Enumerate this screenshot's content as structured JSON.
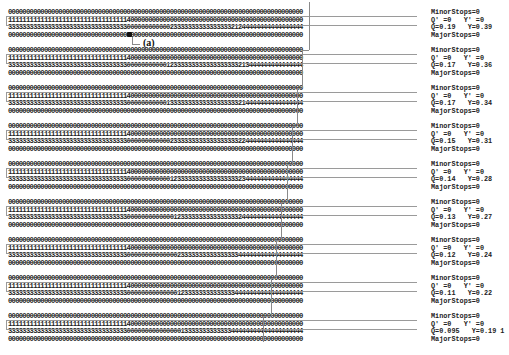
{
  "figure": {
    "annotation_label": "(a)",
    "blocks": [
      {
        "rows": [
          "0000000000000000000000000000000000000000000000000000000000000000000000000000000000",
          "1111111111111111111111111111111114000000000000000000000000000000000000000000000000",
          "3333333333333333333333333333333330000000000002333333333333333321244444444444444444",
          "0000000000000000000000000000000000000000000000000000000000000000000000000000000000"
        ],
        "labels": [
          "MinorStops=0",
          "Q' =0   Y' =0",
          "Q=0.19   Y=0.39",
          "MajorStops=0"
        ]
      },
      {
        "rows": [
          "0000000000000000000000000000000000000000000000000000000000000000000000000000000000",
          "1111111111111111111111111111111114000000000000000000000000000000000000000000000000",
          "3333333333333333333333333333333330000000000012333333333333333333213444444444444444",
          "0000000000000000000000000000000000000000000000000000000000000000000000000000000000"
        ],
        "labels": [
          "MinorStops=0",
          "Q' =0   Y' =0",
          "Q=0.17   Y=0.36",
          "MajorStops=0"
        ]
      },
      {
        "rows": [
          "0000000000000000000000000000000000000000000000000000000000000000000000000000000000",
          "1111111111111111111111111111111114000000000000000000000000000000000000000000000000",
          "3333333333333333333333333333333330000000000013333333333333333333214444444444444444",
          "0000000000000000000000000000000000000000000000000000000000000000000000000000000000"
        ],
        "labels": [
          "MinorStops=0",
          "Q' =0   Y' =0",
          "Q=0.17   Y=0.34",
          "MajorStops=0"
        ]
      },
      {
        "rows": [
          "0000000000000000000000000000000000000000000000000000000000000000000000000000000000",
          "1111111111111111111111111111111114000000000000000000000000000000000000000000000000",
          "3333333333333333333333333333333330000000000002333333333333333333224444444444444444",
          "0000000000000000000000000000000000000000000000000000000000000000000000000000000000"
        ],
        "labels": [
          "MinorStops=0",
          "Q' =0   Y' =0",
          "Q=0.15   Y=0.31",
          "MajorStops=0"
        ]
      },
      {
        "rows": [
          "0000000000000000000000000000000000000000000000000000000000000000000000000000000000",
          "1111111111111111111111111111111114000000000000000000000000000000000000000000000000",
          "3333333333333333333333333333333330000000000001233333333333333333234444444444444444",
          "0000000000000000000000000000000000000000000000000000000000000000000000000000000000"
        ],
        "labels": [
          "MinorStops=0",
          "Q' =0   Y' =0",
          "Q=0.14   Y=0.28",
          "MajorStops=0"
        ]
      },
      {
        "rows": [
          "0000000000000000000000000000000000000000000000000000000000000000000000000000000000",
          "1111111111111111111111111111111114000000000000000000000000000000000000000000000000",
          "3333333333333333333333333333333330000000000000123333333333333333244444444444444444",
          "0000000000000000000000000000000000000000000000000000000000000000000000000000000000"
        ],
        "labels": [
          "MinorStops=0",
          "Q' =0   Y' =0",
          "Q=0.13   Y=0.27",
          "MajorStops=0"
        ]
      },
      {
        "rows": [
          "0000000000000000000000000000000000000000000000000000000000000000000000000000000000",
          "1111111111111111111111111111111114000000000000000000000000000000000000000000000000",
          "3333333333333333333333333333333330000000000000023333333333333333444444444444444444",
          "0000000000000000000000000000000000000000000000000000000000000000000000000000000000"
        ],
        "labels": [
          "MinorStops=0",
          "Q' =0   Y' =0",
          "Q=0.12   Y=0.24",
          "MajorStops=0"
        ]
      },
      {
        "rows": [
          "0000000000000000000000000000000000000000000000000000000000000000000000000000000000",
          "1111111111111111111111111111111114000000000000000000000000000000000000000000000000",
          "3333333333333333333333333333333330000000000000012333333333333334444444444444444444",
          "0000000000000000000000000000000000000000000000000000000000000000000000000000000000"
        ],
        "labels": [
          "MinorStops=0",
          "Q' =0   Y' =0",
          "Q=0.11   Y=0.22",
          "MajorStops=0"
        ]
      },
      {
        "rows": [
          "0000000000000000000000000000000000000000000000000000000000000000000000000000000000",
          "1111111111111111111111111111111114000000000000000000000000000000000000000000000000",
          "3333333333333333333333333333333330000000000000001333333333333344444444444444444444",
          "0000000000000000000000000000000000000000000000000000000000000000000000000000000000"
        ],
        "labels": [
          "MinorStops=0",
          "Q' =0   Y' =0",
          "Q=0.095   Y=0.19 1",
          "MajorStops=0"
        ]
      }
    ]
  }
}
